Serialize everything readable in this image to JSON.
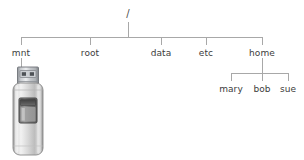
{
  "diagram": {
    "background_color": "#ffffff",
    "line_color": "#a0a0a0",
    "text_color": "#3c3c3c",
    "root": {
      "label": "/",
      "x": 128,
      "y": 14
    },
    "level1": [
      {
        "label": "mnt",
        "x": 21,
        "y": 55
      },
      {
        "label": "root",
        "x": 90,
        "y": 55
      },
      {
        "label": "data",
        "x": 161,
        "y": 55
      },
      {
        "label": "etc",
        "x": 206,
        "y": 55
      },
      {
        "label": "home",
        "x": 262,
        "y": 55
      }
    ],
    "level2": [
      {
        "label": "mary",
        "x": 231,
        "y": 91,
        "parent": "home"
      },
      {
        "label": "bob",
        "x": 262,
        "y": 91,
        "parent": "home"
      },
      {
        "label": "sue",
        "x": 288,
        "y": 91,
        "parent": "home"
      }
    ],
    "device": {
      "name": "usb-flash-drive",
      "attached_to": "mnt",
      "body_color": "#d8d8d8",
      "connector_color": "#b9bcc0",
      "window_color": "#5a5a5a"
    }
  }
}
